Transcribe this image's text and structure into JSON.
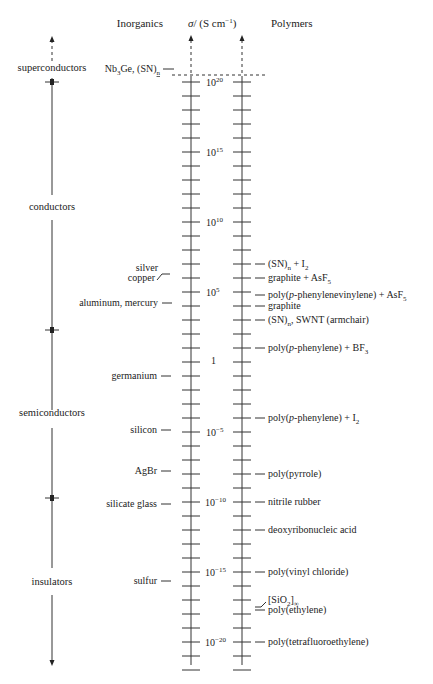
{
  "chart_data": {
    "type": "scale-diagram",
    "title": "",
    "headers": {
      "left": "Inorganics",
      "center": "σ / (S cm⁻¹)",
      "right": "Polymers"
    },
    "ylabel": "σ / (S cm⁻¹)",
    "scale": "log10",
    "ylim_exponent": [
      -22,
      20
    ],
    "decade_ticks": {
      "exponents": [
        20,
        15,
        10,
        5,
        0,
        -5,
        -10,
        -15,
        -20
      ],
      "labels": [
        "10^20",
        "10^15",
        "10^10",
        "10^5",
        "1",
        "10^-5",
        "10^-10",
        "10^-15",
        "10^-20"
      ]
    },
    "minor_tick_step_exponent": 1,
    "categories": [
      {
        "name": "superconductors",
        "range": [
          ">20",
          20
        ]
      },
      {
        "name": "conductors",
        "range": [
          20,
          2
        ]
      },
      {
        "name": "semiconductors",
        "range": [
          2,
          -10
        ]
      },
      {
        "name": "insulators",
        "range": [
          -10,
          "<-22"
        ]
      }
    ],
    "inorganics": [
      {
        "label": "Nb3Ge, (SN)n",
        "exponent": "superconducting"
      },
      {
        "label": "silver",
        "exponent": 5.7
      },
      {
        "label": "copper",
        "exponent": 5.6
      },
      {
        "label": "aluminum, mercury",
        "exponent": 4
      },
      {
        "label": "germanium",
        "exponent": -1
      },
      {
        "label": "silicon",
        "exponent": -5
      },
      {
        "label": "AgBr",
        "exponent": -8
      },
      {
        "label": "silicate glass",
        "exponent": -10
      },
      {
        "label": "sulfur",
        "exponent": -16
      }
    ],
    "polymers": [
      {
        "label": "(SN)n + I2",
        "exponent": 7
      },
      {
        "label": "graphite + AsF5",
        "exponent": 6
      },
      {
        "label": "poly(p-phenylenevinylene) + AsF5",
        "exponent": 4.8
      },
      {
        "label": "graphite",
        "exponent": 4.1
      },
      {
        "label": "(SN)n, SWNT (armchair)",
        "exponent": 3
      },
      {
        "label": "poly(p-phenylene) + BF3",
        "exponent": 1
      },
      {
        "label": "poly(p-phenylene) + I2",
        "exponent": -4
      },
      {
        "label": "poly(pyrrole)",
        "exponent": -8
      },
      {
        "label": "nitrile rubber",
        "exponent": -10
      },
      {
        "label": "deoxyribonucleic acid",
        "exponent": -12
      },
      {
        "label": "poly(vinyl chloride)",
        "exponent": -15
      },
      {
        "label": "[SiO2]∞",
        "exponent": -17.8
      },
      {
        "label": "poly(ethylene)",
        "exponent": -18
      },
      {
        "label": "poly(tetrafluoroethylene)",
        "exponent": -20
      }
    ]
  },
  "headers": {
    "left": "Inorganics",
    "sigma": "σ",
    "unit": "/ (S cm",
    "unit_exp": "−1",
    "unit_close": ")",
    "right": "Polymers"
  },
  "categories": {
    "superconductors": "superconductors",
    "conductors": "conductors",
    "semiconductors": "semiconductors",
    "insulators": "insulators"
  },
  "decades": {
    "d20": "20",
    "d15": "15",
    "d10": "10",
    "d5": "5",
    "one": "1",
    "m5": "−5",
    "m10": "−10",
    "m15": "−15",
    "m20": "−20",
    "base": "10"
  },
  "inorganics": {
    "nb3ge_a": "Nb",
    "nb3ge_sub": "3",
    "nb3ge_b": "Ge, (SN)",
    "nb3ge_n": "n",
    "silver": "silver",
    "copper": "copper",
    "aluminum": "aluminum, mercury",
    "germanium": "germanium",
    "silicon": "silicon",
    "agbr": "AgBr",
    "glass": "silicate glass",
    "sulfur": "sulfur"
  },
  "polymers": {
    "sn_i2_a": "(SN)",
    "sn_i2_n": "n",
    "sn_i2_b": " + I",
    "sn_i2_sub": "2",
    "graphite_asf5": "graphite + AsF",
    "graphite_asf5_sub": "5",
    "ppv_a": "poly(",
    "ppv_p": "p",
    "ppv_b": "-phenylenevinylene) + AsF",
    "ppv_sub": "5",
    "graphite": "graphite",
    "sn_swnt_a": "(SN)",
    "sn_swnt_n": "n",
    "sn_swnt_b": ", SWNT (armchair)",
    "ppp_bf3_a": "poly(",
    "ppp_bf3_p": "p",
    "ppp_bf3_b": "-phenylene) + BF",
    "ppp_bf3_sub": "3",
    "ppp_i2_a": "poly(",
    "ppp_i2_p": "p",
    "ppp_i2_b": "-phenylene) + I",
    "ppp_i2_sub": "2",
    "pyrrole": "poly(pyrrole)",
    "nitrile": "nitrile rubber",
    "dna": "deoxyribonucleic acid",
    "pvc": "poly(vinyl chloride)",
    "sio2_a": "[SiO",
    "sio2_sub": "2",
    "sio2_b": "]",
    "sio2_inf": "∞",
    "pe": "poly(ethylene)",
    "ptfe": "poly(tetrafluoroethylene)"
  }
}
